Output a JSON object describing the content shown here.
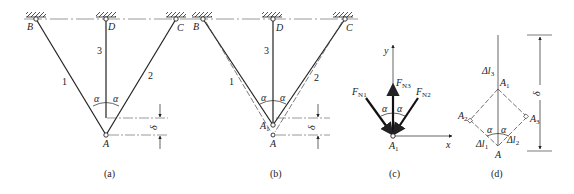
{
  "figure": {
    "panels": [
      {
        "id": "a",
        "caption": "(a)",
        "supports": [
          "B",
          "D",
          "C"
        ],
        "joint": "A",
        "members": [
          "1",
          "2",
          "3"
        ],
        "angle_label": "α",
        "displacement_label": "δ"
      },
      {
        "id": "b",
        "caption": "(b)",
        "supports": [
          "B",
          "D",
          "C"
        ],
        "joints": [
          "A1",
          "A"
        ],
        "members": [
          "1",
          "2",
          "3"
        ],
        "angle_label": "α",
        "displacement_label": "δ"
      },
      {
        "id": "c",
        "caption": "(c)",
        "axes": {
          "x": "x",
          "y": "y"
        },
        "forces": [
          "FN1",
          "FN2",
          "FN3"
        ],
        "joint": "A1",
        "angle_label": "α"
      },
      {
        "id": "d",
        "caption": "(d)",
        "points": [
          "A1",
          "A2",
          "A3",
          "A"
        ],
        "elongations": [
          "Δl1",
          "Δl2",
          "Δl3"
        ],
        "angle_label": "α",
        "displacement_label": "δ"
      }
    ]
  },
  "labels": {
    "a": {
      "B": "B",
      "D": "D",
      "C": "C",
      "A": "A",
      "m1": "1",
      "m2": "2",
      "m3": "3",
      "alpha": "α",
      "delta": "δ",
      "caption": "(a)"
    },
    "b": {
      "B": "B",
      "D": "D",
      "C": "C",
      "A": "A",
      "A1": "A",
      "A1sub": "1",
      "m1": "1",
      "m2": "2",
      "m3": "3",
      "alpha": "α",
      "delta": "δ",
      "caption": "(b)"
    },
    "c": {
      "y": "y",
      "x": "x",
      "F": "F",
      "N1": "N1",
      "N2": "N2",
      "N3": "N3",
      "A1": "A",
      "A1sub": "1",
      "alpha": "α",
      "caption": "(c)"
    },
    "d": {
      "dl3": "Δl",
      "dl3sub": "3",
      "A1": "A",
      "A1sub": "1",
      "A2": "A",
      "A2sub": "2",
      "A3": "A",
      "A3sub": "3",
      "dl1": "Δl",
      "dl1sub": "1",
      "dl2": "Δl",
      "dl2sub": "2",
      "A": "A",
      "alpha": "α",
      "delta": "δ",
      "caption": "(d)"
    }
  },
  "colors": {
    "line": "#222222",
    "background": "#ffffff"
  }
}
